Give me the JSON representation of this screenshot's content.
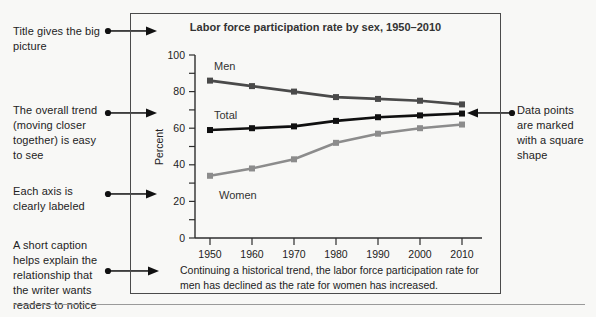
{
  "annotations": {
    "left": [
      {
        "lines": [
          "Title gives the big",
          "picture"
        ]
      },
      {
        "lines": [
          "The overall trend",
          "(moving closer",
          "together) is easy",
          "to see"
        ]
      },
      {
        "lines": [
          "Each axis is",
          "clearly labeled"
        ]
      },
      {
        "lines": [
          "A short caption",
          "helps explain the",
          "relationship that",
          "the writer wants",
          "readers to notice"
        ]
      }
    ],
    "right": {
      "lines": [
        "Data points",
        "are marked",
        "with a square",
        "shape"
      ]
    }
  },
  "chart_data": {
    "type": "line",
    "title": "Labor force participation rate by sex, 1950–2010",
    "x": [
      1950,
      1960,
      1970,
      1980,
      1990,
      2000,
      2010
    ],
    "series": [
      {
        "name": "Men",
        "values": [
          86,
          83,
          80,
          77,
          76,
          75,
          73
        ],
        "color": "#4a4a4a"
      },
      {
        "name": "Total",
        "values": [
          59,
          60,
          61,
          64,
          66,
          67,
          68
        ],
        "color": "#101010"
      },
      {
        "name": "Women",
        "values": [
          34,
          38,
          43,
          52,
          57,
          60,
          62
        ],
        "color": "#8c8c8c"
      }
    ],
    "xlabel": "",
    "ylabel": "Percent",
    "ylim": [
      0,
      100
    ],
    "yticks": [
      0,
      20,
      40,
      60,
      80,
      100
    ],
    "minor_tick_step": 10,
    "grid": false,
    "marker": "square",
    "legend_position": "inline-labels",
    "caption": [
      "Continuing a historical trend, the labor force participation rate for",
      "men has declined as the rate for women has increased."
    ]
  },
  "colors": {
    "ink": "#111111",
    "axis": "#2e2e2e",
    "box_border": "#4b4b4b",
    "rule": "#9a9a9a"
  }
}
